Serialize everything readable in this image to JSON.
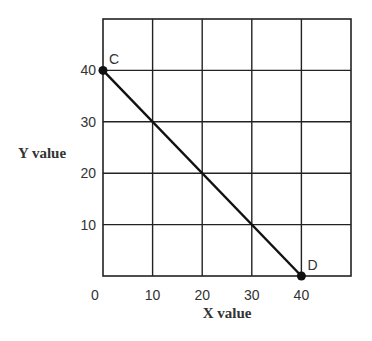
{
  "chart_data": {
    "type": "line",
    "title": "",
    "xlabel": "X value",
    "ylabel": "Y value",
    "xlim": [
      0,
      50
    ],
    "ylim": [
      0,
      50
    ],
    "grid": true,
    "x_ticks": [
      0,
      10,
      20,
      30,
      40
    ],
    "x_tick_labels": [
      "0",
      "10",
      "20",
      "30",
      "40"
    ],
    "y_ticks": [
      10,
      20,
      30,
      40
    ],
    "y_tick_labels": [
      "10",
      "20",
      "30",
      "40"
    ],
    "series": [
      {
        "name": "CD",
        "points": [
          {
            "label": "C",
            "x": 0,
            "y": 40
          },
          {
            "label": "D",
            "x": 40,
            "y": 0
          }
        ]
      }
    ]
  }
}
